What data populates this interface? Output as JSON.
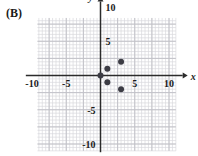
{
  "part_label": "(B)",
  "colors": {
    "grid_minor": "#d8d8dc",
    "grid_major": "#c2c2c8",
    "axis": "#2b2b2b",
    "point": "#3c3c44",
    "text": "#1a1a1a",
    "background": "#ffffff"
  },
  "axes": {
    "x_label": "x",
    "y_label": "y",
    "x_ticks": [
      {
        "value": -10,
        "label": "-10"
      },
      {
        "value": -5,
        "label": "-5"
      },
      {
        "value": 5,
        "label": "5"
      },
      {
        "value": 10,
        "label": "10"
      }
    ],
    "y_ticks": [
      {
        "value": 10,
        "label": "10"
      },
      {
        "value": 5,
        "label": "5"
      },
      {
        "value": -5,
        "label": "-5"
      },
      {
        "value": -10,
        "label": "-10"
      }
    ],
    "xlim": [
      -11,
      11
    ],
    "ylim": [
      -11,
      11
    ],
    "grid": true,
    "minor_grid_step": 0.5,
    "major_grid_step": 2.5
  },
  "chart_data": {
    "type": "scatter",
    "title": "",
    "xlabel": "x",
    "ylabel": "y",
    "xlim": [
      -11,
      11
    ],
    "ylim": [
      -11,
      11
    ],
    "grid": true,
    "legend": null,
    "series": [
      {
        "name": "points",
        "points": [
          {
            "x": 0,
            "y": 0
          },
          {
            "x": 1,
            "y": 1
          },
          {
            "x": 1,
            "y": -1
          },
          {
            "x": 3,
            "y": 2
          },
          {
            "x": 3,
            "y": -2
          }
        ]
      }
    ]
  }
}
